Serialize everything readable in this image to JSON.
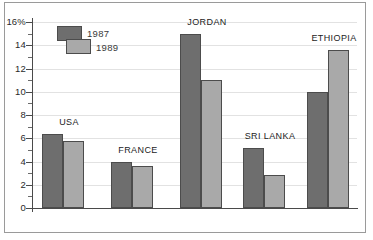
{
  "chart_data": {
    "type": "bar",
    "title": "",
    "subtitle": "",
    "xlabel": "",
    "ylabel": "",
    "ylim": [
      0,
      16
    ],
    "ytick_labels": [
      "0",
      "2",
      "4",
      "6",
      "8",
      "10",
      "12",
      "14",
      "16%"
    ],
    "ytick_values": [
      0,
      2,
      4,
      6,
      8,
      10,
      12,
      14,
      16
    ],
    "minor_tick_values": [
      1,
      3,
      5,
      7,
      9,
      11,
      13,
      15
    ],
    "grid": true,
    "legend_position": "upper-left",
    "categories": [
      "USA",
      "FRANCE",
      "JORDAN",
      "SRI LANKA",
      "ETHIOPIA"
    ],
    "series": [
      {
        "name": "1987",
        "color": "#6e6e6e",
        "values": [
          6.35,
          4.0,
          15.0,
          5.2,
          10.0
        ]
      },
      {
        "name": "1989",
        "color": "#a9a9a9",
        "values": [
          5.8,
          3.6,
          11.0,
          2.8,
          13.6
        ]
      }
    ]
  },
  "figure": {
    "frame_color": "#9a9a9a",
    "axis_color": "#4a4a4a",
    "grid_color": "#e2e2e2",
    "background": "#ffffff"
  }
}
